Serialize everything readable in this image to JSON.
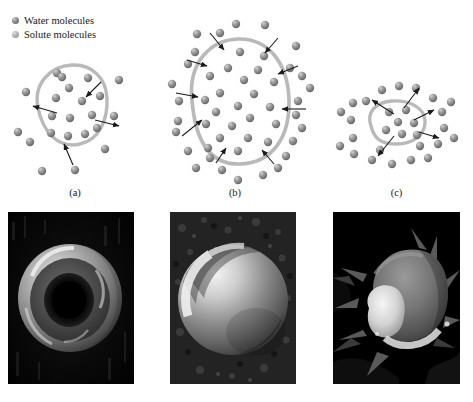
{
  "figure": {
    "background_color": "#ffffff"
  },
  "legend": {
    "items": [
      {
        "label": "Water molecules",
        "marker": "water-molecule-dot",
        "color": "#6e6e6e"
      },
      {
        "label": "Solute molecules",
        "marker": "solute-molecule-dot",
        "color": "#9a9a9a"
      }
    ]
  },
  "panels": [
    {
      "id": "a",
      "label": "(a)",
      "condition": "isotonic",
      "description": "Cell in isotonic solution; water moves in and out equally; cell keeps normal shape",
      "membrane_color": "#b9b9b9",
      "arrow_direction": "both",
      "cell_size": "normal",
      "molecules_inside": 11,
      "molecules_outside": 11,
      "arrows": 4
    },
    {
      "id": "b",
      "label": "(b)",
      "condition": "hypotonic",
      "description": "Cell in hypotonic solution; net water movement into the cell; cell swells",
      "membrane_color": "#b9b9b9",
      "arrow_direction": "inward",
      "cell_size": "swollen",
      "molecules_inside": 22,
      "molecules_outside": 26,
      "arrows": 8
    },
    {
      "id": "c",
      "label": "(c)",
      "condition": "hypertonic",
      "description": "Cell in hypertonic solution; net water movement out of the cell; cell shrinks and crenates",
      "membrane_color": "#b9b9b9",
      "arrow_direction": "outward",
      "cell_size": "shrunken",
      "molecules_inside": 7,
      "molecules_outside": 22,
      "arrows": 5
    }
  ],
  "micrographs": [
    {
      "id": "micrograph-a",
      "caption": "",
      "subject": "normal biconcave red blood cell",
      "background_color": "#000000",
      "cell_shape": "biconcave-disc"
    },
    {
      "id": "micrograph-b",
      "caption": "",
      "subject": "swollen spherical red blood cell",
      "background_color": "#1b1b1b",
      "cell_shape": "sphere"
    },
    {
      "id": "micrograph-c",
      "caption": "",
      "subject": "crenated shrunken red blood cell",
      "background_color": "#000000",
      "cell_shape": "crenated"
    }
  ]
}
